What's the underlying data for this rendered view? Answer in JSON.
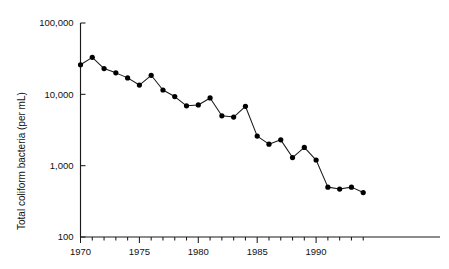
{
  "chart_data": {
    "type": "line",
    "title": "",
    "xlabel": "",
    "ylabel": "Total coliform bacteria (per mL)",
    "yscale": "log",
    "ylim": [
      100,
      100000
    ],
    "xlim": [
      1969.5,
      1994.5
    ],
    "grid": false,
    "legend": false,
    "ytick_labels": [
      "100,000",
      "10,000",
      "1,000",
      "100"
    ],
    "ytick_values": [
      100000,
      10000,
      1000,
      100
    ],
    "xtick_labels": [
      "1970",
      "1975",
      "1980",
      "1985",
      "1990"
    ],
    "xtick_values": [
      1970,
      1975,
      1980,
      1985,
      1990
    ],
    "x_minor_ticks": [
      1971,
      1972,
      1973,
      1974,
      1976,
      1977,
      1978,
      1979,
      1981,
      1982,
      1983,
      1984,
      1986,
      1987,
      1988,
      1989,
      1991,
      1992,
      1993,
      1994
    ],
    "marker": "filled-circle",
    "line_color": "#1a1a1a",
    "marker_color": "#000000",
    "x": [
      1970,
      1971,
      1972,
      1973,
      1974,
      1975,
      1976,
      1977,
      1978,
      1979,
      1980,
      1981,
      1982,
      1983,
      1984,
      1985,
      1986,
      1987,
      1988,
      1989,
      1990,
      1991,
      1992,
      1993,
      1994
    ],
    "values": [
      26000,
      33000,
      23000,
      20000,
      17000,
      13500,
      18500,
      11500,
      9300,
      6900,
      7100,
      8900,
      5000,
      4800,
      6800,
      2600,
      2000,
      2300,
      1300,
      1800,
      1200,
      500,
      470,
      500,
      420
    ],
    "series": [
      {
        "name": "Total coliform bacteria",
        "values": [
          26000,
          33000,
          23000,
          20000,
          17000,
          13500,
          18500,
          11500,
          9300,
          6900,
          7100,
          8900,
          5000,
          4800,
          6800,
          2600,
          2000,
          2300,
          1300,
          1800,
          1200,
          500,
          470,
          500,
          420
        ]
      }
    ]
  },
  "axes": {
    "y_title": "Total coliform bacteria (per mL)"
  }
}
